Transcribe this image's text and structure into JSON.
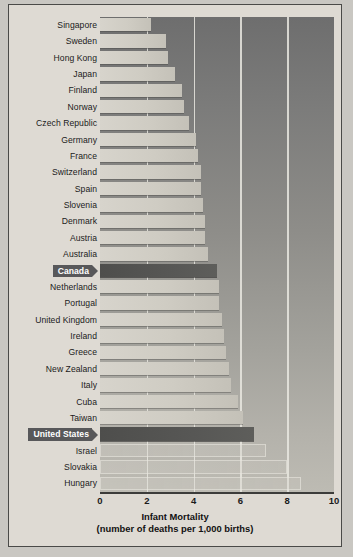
{
  "chart_data": {
    "type": "bar",
    "orientation": "horizontal",
    "title": "Infant Mortality",
    "subtitle": "(number of deaths per 1,000 births)",
    "xlabel": "Infant Mortality (number of deaths per 1,000 births)",
    "ylabel": "",
    "xlim": [
      0,
      10
    ],
    "xticks": [
      0,
      2,
      4,
      6,
      8,
      10
    ],
    "xticklabels": [
      "0",
      "2",
      "4",
      "6",
      "8",
      "10"
    ],
    "grid": "vertical gridlines at 2, 4, 6, 8",
    "legend": "none",
    "highlight_color": "#58585a",
    "bar_color": "#d0cdc4",
    "plot_background": "#8e8d89",
    "categories": [
      "Singapore",
      "Sweden",
      "Hong Kong",
      "Japan",
      "Finland",
      "Norway",
      "Czech Republic",
      "Germany",
      "France",
      "Switzerland",
      "Spain",
      "Slovenia",
      "Denmark",
      "Austria",
      "Australia",
      "Canada",
      "Netherlands",
      "Portugal",
      "United Kingdom",
      "Ireland",
      "Greece",
      "New Zealand",
      "Italy",
      "Cuba",
      "Taiwan",
      "United States",
      "Israel",
      "Slovakia",
      "Hungary"
    ],
    "values": [
      2.2,
      2.8,
      2.9,
      3.2,
      3.5,
      3.6,
      3.8,
      4.1,
      4.2,
      4.3,
      4.3,
      4.4,
      4.5,
      4.5,
      4.6,
      5.0,
      5.1,
      5.1,
      5.2,
      5.3,
      5.4,
      5.5,
      5.6,
      5.9,
      6.1,
      6.6,
      7.1,
      8.0,
      8.6
    ],
    "highlighted": [
      "Canada",
      "United States"
    ],
    "faint_rows": [
      "Israel",
      "Slovakia",
      "Hungary"
    ]
  },
  "axis": {
    "title_line1": "Infant Mortality",
    "title_line2": "(number of deaths per 1,000 births)"
  }
}
